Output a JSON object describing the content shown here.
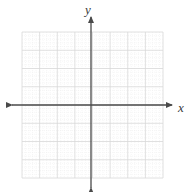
{
  "figure": {
    "kind": "cartesian-coordinate-grid",
    "width": 193,
    "height": 192,
    "background_color": "#ffffff"
  },
  "labels": {
    "y_axis_label": "y",
    "x_axis_label": "x"
  },
  "colors": {
    "axis": "#4a4a4a",
    "major_grid": "#d8d8d8",
    "minor_grid": "#ededed",
    "label": "#3a3a3a",
    "background": "#ffffff"
  },
  "chart_data": {
    "type": "scatter",
    "title": "",
    "subtitle": "",
    "xlabel": "x",
    "ylabel": "y",
    "series": [
      {
        "name": "",
        "x": [],
        "y": []
      }
    ],
    "xlim": [
      -4,
      4
    ],
    "ylim": [
      -4,
      4
    ],
    "xticks": [
      -4,
      -3,
      -2,
      -1,
      0,
      1,
      2,
      3,
      4
    ],
    "yticks": [
      -4,
      -3,
      -2,
      -1,
      0,
      1,
      2,
      3,
      4
    ],
    "xticklabels": [
      "",
      "",
      "",
      "",
      "",
      "",
      "",
      "",
      ""
    ],
    "yticklabels": [
      "",
      "",
      "",
      "",
      "",
      "",
      "",
      "",
      ""
    ],
    "grid": true,
    "minor_grid": true,
    "minor_divisions_per_major": 5,
    "legend": false,
    "legend_position": "none",
    "annotations": [],
    "axis_arrows": {
      "x_left": true,
      "x_right": true,
      "y_up": true,
      "y_down": true
    },
    "geometry": {
      "grid_left_px": 22,
      "grid_right_px": 163,
      "grid_top_px": 32,
      "grid_bottom_px": 178,
      "origin_x_px": 91,
      "origin_y_px": 105,
      "major_step_x_px": 17.6,
      "major_step_y_px": 18.25,
      "x_axis_start_px": 12,
      "x_axis_end_px": 172,
      "y_axis_start_px": 17,
      "y_axis_end_px": 188
    }
  }
}
